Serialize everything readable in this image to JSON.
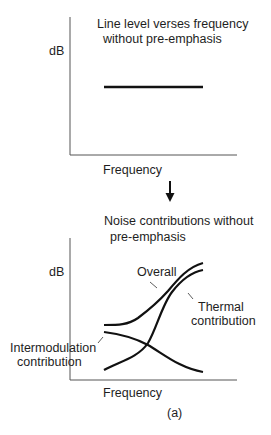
{
  "top_chart": {
    "title_line1": "Line  level verses frequency",
    "title_line2": "without pre-emphasis",
    "ylabel": "dB",
    "xlabel": "Frequency",
    "series": [
      {
        "name": "Line level",
        "shape": "flat"
      }
    ]
  },
  "arrow": {
    "icon": "down-arrow-icon"
  },
  "bottom_chart": {
    "title_line1": "Noise contributions without",
    "title_line2": "pre-emphasis",
    "ylabel": "dB",
    "xlabel": "Frequency",
    "annotations": {
      "overall": "Overall",
      "thermal_line1": "Thermal",
      "thermal_line2": "contribution",
      "intermod_line1": "Intermodulation",
      "intermod_line2": "contribution"
    },
    "series": [
      {
        "name": "Overall",
        "shape": "flat then rising"
      },
      {
        "name": "Thermal contribution",
        "shape": "rising"
      },
      {
        "name": "Intermodulation contribution",
        "shape": "falling"
      }
    ]
  },
  "caption": "(a)"
}
